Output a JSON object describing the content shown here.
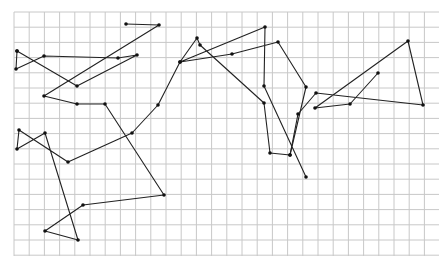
{
  "figure": {
    "grid": {
      "x0": 14,
      "y0": 12,
      "x1": 439,
      "y1": 256,
      "cell": 15.2,
      "line_color": "#c8c8c8"
    },
    "stroke_color": "#222222",
    "point_color": "#111111",
    "paths": [
      {
        "name": "path-a",
        "points": [
          [
            126,
            24
          ],
          [
            159,
            25
          ],
          [
            44,
            96
          ],
          [
            77,
            104
          ],
          [
            105,
            104
          ],
          [
            164,
            195
          ],
          [
            83,
            205
          ],
          [
            45,
            231
          ],
          [
            78,
            240
          ],
          [
            45,
            133
          ],
          [
            17,
            149
          ],
          [
            19,
            130
          ],
          [
            68,
            162
          ],
          [
            132,
            133
          ],
          [
            158,
            105
          ],
          [
            180,
            62
          ],
          [
            197,
            38
          ],
          [
            200,
            45
          ],
          [
            264,
            103
          ],
          [
            270,
            153
          ],
          [
            290,
            155
          ],
          [
            306,
            87
          ],
          [
            278,
            42
          ],
          [
            232,
            54
          ],
          [
            180,
            62
          ],
          [
            265,
            27
          ],
          [
            264,
            86
          ],
          [
            306,
            177
          ]
        ]
      },
      {
        "name": "path-b",
        "points": [
          [
            17,
            51
          ],
          [
            16,
            69
          ],
          [
            44,
            56
          ],
          [
            118,
            58
          ],
          [
            137,
            55
          ],
          [
            77,
            86
          ],
          [
            17,
            51
          ]
        ]
      },
      {
        "name": "path-c",
        "points": [
          [
            290,
            155
          ],
          [
            298,
            114
          ],
          [
            316,
            93
          ],
          [
            423,
            105
          ],
          [
            408,
            41
          ],
          [
            315,
            108
          ],
          [
            350,
            104
          ],
          [
            378,
            73
          ]
        ]
      }
    ]
  }
}
